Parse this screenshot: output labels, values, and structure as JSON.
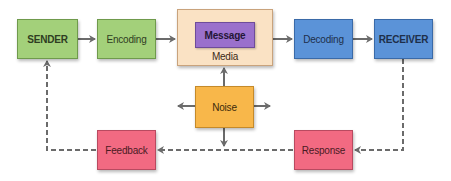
{
  "diagram": {
    "nodes": {
      "sender": {
        "label": "SENDER",
        "color": "#a3d07a"
      },
      "encoding": {
        "label": "Encoding",
        "color": "#a3d07a"
      },
      "media": {
        "label": "Media",
        "color": "#fae2c4"
      },
      "message": {
        "label": "Message",
        "color": "#9a70cc"
      },
      "decoding": {
        "label": "Decoding",
        "color": "#5b93d8"
      },
      "receiver": {
        "label": "RECEIVER",
        "color": "#5b93d8"
      },
      "noise": {
        "label": "Noise",
        "color": "#f8b74a"
      },
      "feedback": {
        "label": "Feedback",
        "color": "#f26a82"
      },
      "response": {
        "label": "Response",
        "color": "#f26a82"
      }
    },
    "edges": [
      {
        "from": "SENDER",
        "to": "Encoding",
        "style": "solid"
      },
      {
        "from": "Encoding",
        "to": "Media",
        "style": "solid"
      },
      {
        "from": "Media",
        "to": "Decoding",
        "style": "solid"
      },
      {
        "from": "Decoding",
        "to": "RECEIVER",
        "style": "solid"
      },
      {
        "from": "Noise",
        "to": "Media",
        "style": "solid"
      },
      {
        "from": "Noise",
        "to": "left",
        "style": "solid"
      },
      {
        "from": "Noise",
        "to": "right",
        "style": "solid"
      },
      {
        "from": "Noise",
        "to": "feedback-line",
        "style": "solid"
      },
      {
        "from": "RECEIVER",
        "to": "Response",
        "style": "dashed"
      },
      {
        "from": "Response",
        "to": "Feedback",
        "style": "dashed"
      },
      {
        "from": "Feedback",
        "to": "SENDER",
        "style": "dashed"
      }
    ],
    "line_color": "#6b6b6b"
  }
}
